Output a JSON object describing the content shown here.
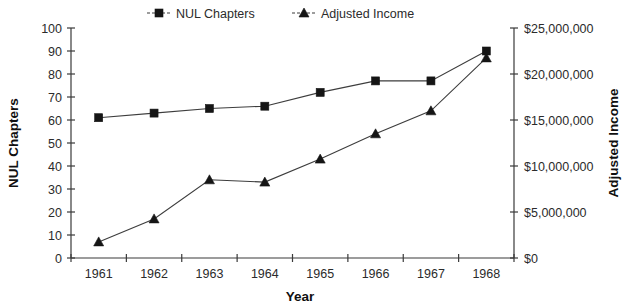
{
  "chart_data": {
    "type": "line",
    "title": "",
    "xlabel": "Year",
    "ylabel": "NUL Chapters",
    "y2label": "Adjusted Income",
    "categories": [
      "1961",
      "1962",
      "1963",
      "1964",
      "1965",
      "1966",
      "1967",
      "1968"
    ],
    "x": [
      1961,
      1962,
      1963,
      1964,
      1965,
      1966,
      1967,
      1968
    ],
    "ylim": [
      0,
      100
    ],
    "y2lim": [
      0,
      25000000
    ],
    "grid": false,
    "legend_position": "top-center",
    "series": [
      {
        "name": "NUL Chapters",
        "axis": "left",
        "marker": "square",
        "values": [
          61,
          63,
          65,
          66,
          72,
          77,
          77,
          90
        ]
      },
      {
        "name": "Adjusted Income",
        "axis": "right",
        "marker": "triangle",
        "values": [
          1750000,
          4250000,
          8500000,
          8250000,
          10750000,
          13500000,
          16000000,
          21750000
        ]
      }
    ],
    "yticks": [
      0,
      10,
      20,
      30,
      40,
      50,
      60,
      70,
      80,
      90,
      100
    ],
    "yticklabels": [
      "0",
      "10",
      "20",
      "30",
      "40",
      "50",
      "60",
      "70",
      "80",
      "90",
      "100"
    ],
    "y2ticks": [
      0,
      5000000,
      10000000,
      15000000,
      20000000,
      25000000
    ],
    "y2ticklabels": [
      "$0",
      "$5,000,000",
      "$10,000,000",
      "$15,000,000",
      "$20,000,000",
      "$25,000,000"
    ],
    "xticklabels": [
      "1961",
      "1962",
      "1963",
      "1964",
      "1965",
      "1966",
      "1967",
      "1968"
    ]
  },
  "legend": {
    "items": [
      {
        "label": "NUL Chapters",
        "marker": "square-marker-icon"
      },
      {
        "label": "Adjusted Income",
        "marker": "triangle-marker-icon"
      }
    ]
  },
  "axes": {
    "left_title": "NUL Chapters",
    "right_title": "Adjusted Income",
    "x_title": "Year"
  },
  "colors": {
    "line": "#3d3d3d",
    "marker": "#151515",
    "axis": "#3a3a3a",
    "text": "#2b2b2b",
    "background": "#ffffff"
  }
}
